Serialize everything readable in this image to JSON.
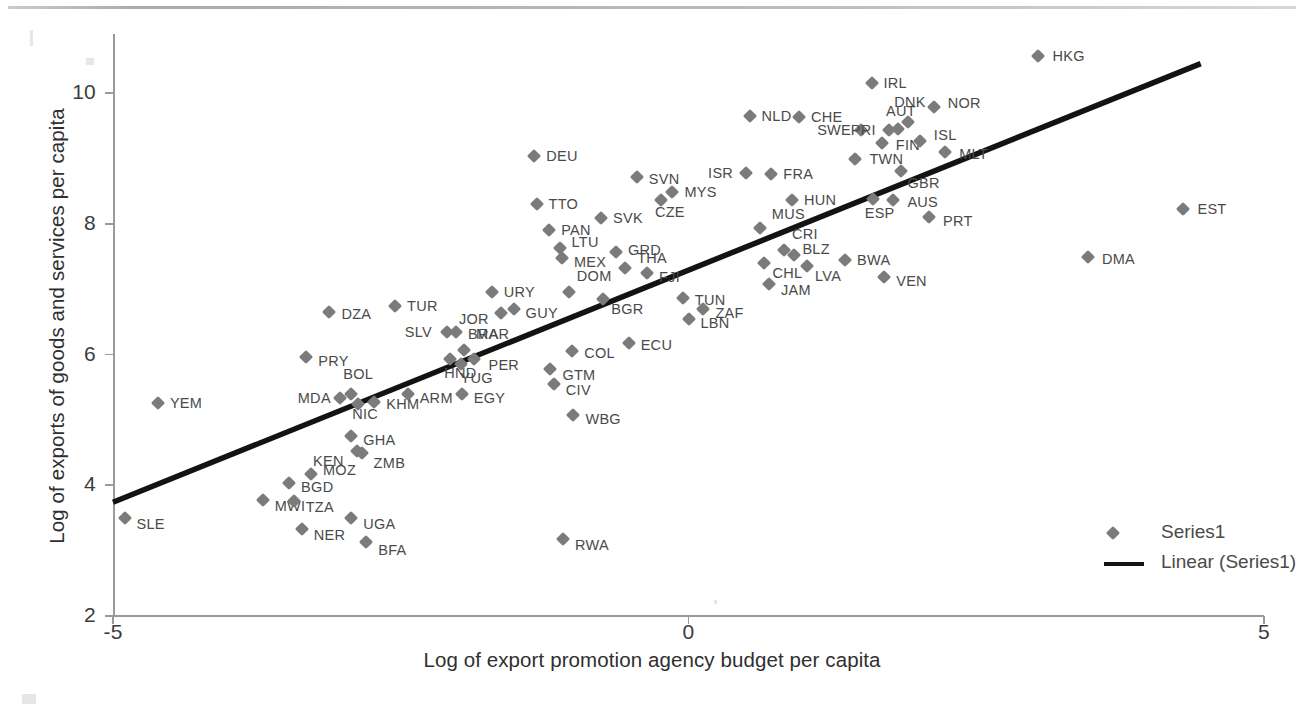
{
  "chart_data": {
    "type": "scatter",
    "title": "",
    "xlabel": "Log of export promotion agency budget per capita",
    "ylabel": "Log of exports of goods and services per capita",
    "xlim": [
      -5,
      5
    ],
    "ylim": [
      2,
      11
    ],
    "xticks": [
      "-5",
      "0",
      "5"
    ],
    "yticks": [
      "10",
      "8",
      "6",
      "4",
      "2"
    ],
    "grid": false,
    "legend_position": "bottom-right",
    "marker_color": "#7b7b7b",
    "trendline_color": "#131313",
    "series": [
      {
        "name": "Series1",
        "marker": "diamond",
        "points": [
          {
            "label": "SLE",
            "x": -4.9,
            "y": 3.5,
            "lx": 12,
            "ly": 6
          },
          {
            "label": "YEM",
            "x": -4.61,
            "y": 5.26,
            "lx": 12,
            "ly": 0
          },
          {
            "label": "MWI",
            "x": -3.7,
            "y": 3.77,
            "lx": 12,
            "ly": 6
          },
          {
            "label": "PRY",
            "x": -3.32,
            "y": 5.96,
            "lx": 12,
            "ly": 4
          },
          {
            "label": "DZA",
            "x": -3.12,
            "y": 6.65,
            "lx": 12,
            "ly": 2
          },
          {
            "label": "BGD",
            "x": -3.47,
            "y": 4.03,
            "lx": 12,
            "ly": 4
          },
          {
            "label": "TZA",
            "x": -3.43,
            "y": 3.76,
            "lx": 12,
            "ly": 6
          },
          {
            "label": "NER",
            "x": -3.36,
            "y": 3.33,
            "lx": 12,
            "ly": 6
          },
          {
            "label": "MOZ",
            "x": -3.28,
            "y": 4.17,
            "lx": 12,
            "ly": -4
          },
          {
            "label": "MDA",
            "x": -3.03,
            "y": 5.34,
            "lx": -42,
            "ly": 0
          },
          {
            "label": "BOL",
            "x": -2.93,
            "y": 5.39,
            "lx": -8,
            "ly": -20
          },
          {
            "label": "NIC",
            "x": -2.87,
            "y": 5.25,
            "lx": -6,
            "ly": 10
          },
          {
            "label": "GHA",
            "x": -2.93,
            "y": 4.76,
            "lx": 12,
            "ly": 4
          },
          {
            "label": "KEN",
            "x": -2.88,
            "y": 4.53,
            "lx": -44,
            "ly": 10
          },
          {
            "label": "ZMB",
            "x": -2.84,
            "y": 4.5,
            "lx": 12,
            "ly": 10
          },
          {
            "label": "UGA",
            "x": -2.93,
            "y": 3.5,
            "lx": 12,
            "ly": 6
          },
          {
            "label": "BFA",
            "x": -2.8,
            "y": 3.13,
            "lx": 12,
            "ly": 8
          },
          {
            "label": "KHM",
            "x": -2.73,
            "y": 5.28,
            "lx": 12,
            "ly": 2
          },
          {
            "label": "TUR",
            "x": -2.55,
            "y": 6.74,
            "lx": 12,
            "ly": 0
          },
          {
            "label": "ARM",
            "x": -2.44,
            "y": 5.39,
            "lx": 12,
            "ly": 4
          },
          {
            "label": "SLV",
            "x": -2.1,
            "y": 6.34,
            "lx": -42,
            "ly": 0
          },
          {
            "label": "BRA",
            "x": -2.02,
            "y": 6.35,
            "lx": 12,
            "ly": 2
          },
          {
            "label": "MAR",
            "x": -1.95,
            "y": 6.07,
            "lx": 12,
            "ly": -16
          },
          {
            "label": "HND",
            "x": -2.07,
            "y": 5.93,
            "lx": -6,
            "ly": 14
          },
          {
            "label": "YUG",
            "x": -1.98,
            "y": 5.86,
            "lx": 0,
            "ly": 14
          },
          {
            "label": "PER",
            "x": -1.86,
            "y": 5.93,
            "lx": 14,
            "ly": 6
          },
          {
            "label": "EGY",
            "x": -1.97,
            "y": 5.39,
            "lx": 12,
            "ly": 4
          },
          {
            "label": "URY",
            "x": -1.71,
            "y": 6.96,
            "lx": 12,
            "ly": 0
          },
          {
            "label": "JOR",
            "x": -1.63,
            "y": 6.63,
            "lx": -42,
            "ly": 6
          },
          {
            "label": "GUY",
            "x": -1.52,
            "y": 6.69,
            "lx": 12,
            "ly": 4
          },
          {
            "label": "TTO",
            "x": -1.32,
            "y": 8.3,
            "lx": 12,
            "ly": 0
          },
          {
            "label": "PAN",
            "x": -1.21,
            "y": 7.9,
            "lx": 12,
            "ly": 0
          },
          {
            "label": "LTU",
            "x": -1.12,
            "y": 7.63,
            "lx": 12,
            "ly": -6
          },
          {
            "label": "MEX",
            "x": -1.1,
            "y": 7.48,
            "lx": 12,
            "ly": 4
          },
          {
            "label": "DOM",
            "x": -1.04,
            "y": 6.95,
            "lx": 8,
            "ly": -16
          },
          {
            "label": "GTM",
            "x": -1.2,
            "y": 5.78,
            "lx": 12,
            "ly": 6
          },
          {
            "label": "CIV",
            "x": -1.17,
            "y": 5.55,
            "lx": 12,
            "ly": 6
          },
          {
            "label": "COL",
            "x": -1.01,
            "y": 6.05,
            "lx": 12,
            "ly": 2
          },
          {
            "label": "WBG",
            "x": -1.0,
            "y": 5.08,
            "lx": 12,
            "ly": 4
          },
          {
            "label": "RWA",
            "x": -1.09,
            "y": 3.18,
            "lx": 12,
            "ly": 6
          },
          {
            "label": "DEU",
            "x": -1.34,
            "y": 9.03,
            "lx": 12,
            "ly": 0
          },
          {
            "label": "SVK",
            "x": -0.76,
            "y": 8.09,
            "lx": 12,
            "ly": 0
          },
          {
            "label": "GRD",
            "x": -0.63,
            "y": 7.57,
            "lx": 12,
            "ly": -2
          },
          {
            "label": "THA",
            "x": -0.55,
            "y": 7.33,
            "lx": 12,
            "ly": -10
          },
          {
            "label": "BGR",
            "x": -0.74,
            "y": 6.85,
            "lx": 8,
            "ly": 10
          },
          {
            "label": "ECU",
            "x": -0.52,
            "y": 6.17,
            "lx": 12,
            "ly": 2
          },
          {
            "label": "SVN",
            "x": -0.45,
            "y": 8.72,
            "lx": 12,
            "ly": 2
          },
          {
            "label": "CZE",
            "x": -0.24,
            "y": 8.36,
            "lx": -6,
            "ly": 12
          },
          {
            "label": "MYS",
            "x": -0.14,
            "y": 8.48,
            "lx": 12,
            "ly": 0
          },
          {
            "label": "FJI",
            "x": -0.36,
            "y": 7.24,
            "lx": 12,
            "ly": 4
          },
          {
            "label": "TUN",
            "x": -0.05,
            "y": 6.86,
            "lx": 12,
            "ly": 2
          },
          {
            "label": "LBN",
            "x": 0.0,
            "y": 6.55,
            "lx": 12,
            "ly": 4
          },
          {
            "label": "ZAF",
            "x": 0.13,
            "y": 6.69,
            "lx": 12,
            "ly": 4
          },
          {
            "label": "ISR",
            "x": 0.5,
            "y": 8.77,
            "lx": -38,
            "ly": 0
          },
          {
            "label": "FRA",
            "x": 0.72,
            "y": 8.76,
            "lx": 12,
            "ly": 0
          },
          {
            "label": "NLD",
            "x": 0.53,
            "y": 9.65,
            "lx": 12,
            "ly": 0
          },
          {
            "label": "CHE",
            "x": 0.96,
            "y": 9.63,
            "lx": 12,
            "ly": 0
          },
          {
            "label": "HUN",
            "x": 0.9,
            "y": 8.37,
            "lx": 12,
            "ly": 0
          },
          {
            "label": "MUS",
            "x": 0.62,
            "y": 7.93,
            "lx": 12,
            "ly": -14
          },
          {
            "label": "CRI",
            "x": 0.83,
            "y": 7.6,
            "lx": 8,
            "ly": -16
          },
          {
            "label": "CHL",
            "x": 0.66,
            "y": 7.4,
            "lx": 8,
            "ly": 10
          },
          {
            "label": "JAM",
            "x": 0.7,
            "y": 7.08,
            "lx": 12,
            "ly": 6
          },
          {
            "label": "BLZ",
            "x": 0.92,
            "y": 7.52,
            "lx": 8,
            "ly": -6
          },
          {
            "label": "LVA",
            "x": 1.03,
            "y": 7.35,
            "lx": 8,
            "ly": 10
          },
          {
            "label": "BWA",
            "x": 1.36,
            "y": 7.45,
            "lx": 12,
            "ly": 0
          },
          {
            "label": "VEN",
            "x": 1.7,
            "y": 7.18,
            "lx": 12,
            "ly": 4
          },
          {
            "label": "IRL",
            "x": 1.59,
            "y": 10.15,
            "lx": 12,
            "ly": 0
          },
          {
            "label": "SWE",
            "x": 1.5,
            "y": 9.43,
            "lx": -44,
            "ly": 0
          },
          {
            "label": "PRI",
            "x": 1.74,
            "y": 9.43,
            "lx": -38,
            "ly": 0
          },
          {
            "label": "AUT",
            "x": 1.82,
            "y": 9.45,
            "lx": -12,
            "ly": -18
          },
          {
            "label": "DNK",
            "x": 1.91,
            "y": 9.56,
            "lx": -14,
            "ly": -20
          },
          {
            "label": "NOR",
            "x": 2.13,
            "y": 9.78,
            "lx": 14,
            "ly": -4
          },
          {
            "label": "FIN",
            "x": 1.68,
            "y": 9.23,
            "lx": 14,
            "ly": 2
          },
          {
            "label": "ISL",
            "x": 2.01,
            "y": 9.27,
            "lx": 14,
            "ly": -6
          },
          {
            "label": "TWN",
            "x": 1.45,
            "y": 8.99,
            "lx": 14,
            "ly": 0
          },
          {
            "label": "GBR",
            "x": 1.85,
            "y": 8.8,
            "lx": 6,
            "ly": 12
          },
          {
            "label": "MLT",
            "x": 2.23,
            "y": 9.09,
            "lx": 14,
            "ly": 2
          },
          {
            "label": "ESP",
            "x": 1.6,
            "y": 8.38,
            "lx": -8,
            "ly": 14
          },
          {
            "label": "AUS",
            "x": 1.78,
            "y": 8.37,
            "lx": 14,
            "ly": 2
          },
          {
            "label": "PRT",
            "x": 2.09,
            "y": 8.11,
            "lx": 14,
            "ly": 4
          },
          {
            "label": "HKG",
            "x": 3.04,
            "y": 10.57,
            "lx": 14,
            "ly": 0
          },
          {
            "label": "EST",
            "x": 4.3,
            "y": 8.22,
            "lx": 14,
            "ly": 0
          },
          {
            "label": "DMA",
            "x": 3.47,
            "y": 7.49,
            "lx": 14,
            "ly": 2
          }
        ]
      }
    ],
    "trendline": {
      "name": "Linear (Series1)",
      "x_start": -5.0,
      "y_start": 3.74,
      "x_end": 4.45,
      "y_end": 10.45
    }
  },
  "legend": {
    "items": [
      {
        "label": "Series1",
        "type": "marker"
      },
      {
        "label": "Linear (Series1)",
        "type": "line"
      }
    ]
  }
}
